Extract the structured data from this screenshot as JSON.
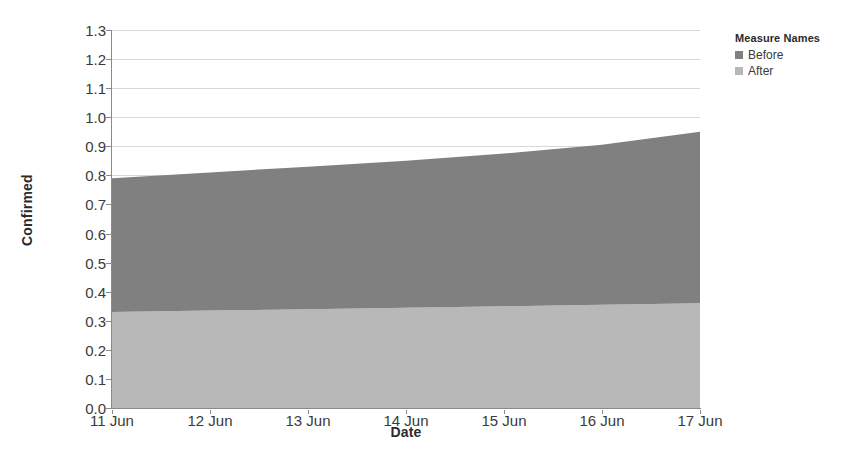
{
  "chart_data": {
    "type": "area",
    "stacked": true,
    "title": "",
    "xlabel": "Date",
    "ylabel": "Confirmed",
    "x": [
      "11 Jun",
      "12 Jun",
      "13 Jun",
      "14 Jun",
      "15 Jun",
      "16 Jun",
      "17 Jun"
    ],
    "xtick_labels": [
      "11 Jun",
      "12 Jun",
      "13 Jun",
      "14 Jun",
      "15 Jun",
      "16 Jun",
      "17 Jun"
    ],
    "ytick_labels": [
      "0.0",
      "0.1",
      "0.2",
      "0.3",
      "0.4",
      "0.5",
      "0.6",
      "0.7",
      "0.8",
      "0.9",
      "1.0",
      "1.1",
      "1.2",
      "1.3"
    ],
    "ylim": [
      0.0,
      1.3
    ],
    "ytick_step": 0.1,
    "grid": true,
    "legend_position": "right",
    "series": [
      {
        "name": "After",
        "color": "#b8b8b8",
        "stack_order": 0,
        "values": [
          0.33,
          0.335,
          0.34,
          0.345,
          0.35,
          0.355,
          0.36
        ]
      },
      {
        "name": "Before",
        "color": "#808080",
        "stack_order": 1,
        "values": [
          0.46,
          0.475,
          0.49,
          0.505,
          0.525,
          0.55,
          0.59
        ]
      }
    ],
    "cumulative_top": [
      0.79,
      0.81,
      0.83,
      0.85,
      0.875,
      0.905,
      0.95
    ]
  },
  "legend": {
    "title": "Measure Names",
    "items": [
      {
        "label": "Before",
        "color": "#808080"
      },
      {
        "label": "After",
        "color": "#b8b8b8"
      }
    ]
  },
  "axes": {
    "y_title": "Confirmed",
    "x_title": "Date"
  }
}
